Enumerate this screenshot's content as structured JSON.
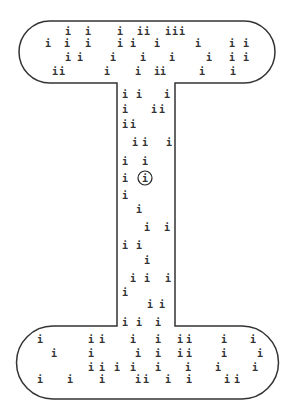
{
  "puzzle": {
    "shape": "I-beam",
    "glyph": "i",
    "colors": {
      "ink": "#333333",
      "background": "#ffffff"
    },
    "outline": {
      "top_bar": {
        "x": 19,
        "y": 21,
        "w": 256,
        "h": 62,
        "r": 31
      },
      "stem": {
        "x": 117,
        "w": 58
      },
      "bottom_bar": {
        "x": 20,
        "y": 326,
        "w": 255,
        "h": 73,
        "r": 33
      }
    },
    "circled": {
      "x": 145,
      "y": 178
    },
    "glyphs": [
      [
        68,
        31
      ],
      [
        88,
        31
      ],
      [
        120,
        31
      ],
      [
        140,
        31
      ],
      [
        147,
        31
      ],
      [
        168,
        31
      ],
      [
        175,
        31
      ],
      [
        182,
        31
      ],
      [
        48,
        43
      ],
      [
        67,
        43
      ],
      [
        88,
        43
      ],
      [
        120,
        43
      ],
      [
        133,
        43
      ],
      [
        157,
        43
      ],
      [
        198,
        43
      ],
      [
        232,
        43
      ],
      [
        246,
        43
      ],
      [
        68,
        57
      ],
      [
        80,
        57
      ],
      [
        113,
        57
      ],
      [
        143,
        57
      ],
      [
        172,
        57
      ],
      [
        209,
        57
      ],
      [
        232,
        57
      ],
      [
        246,
        57
      ],
      [
        55,
        71
      ],
      [
        62,
        71
      ],
      [
        107,
        71
      ],
      [
        138,
        71
      ],
      [
        157,
        71
      ],
      [
        163,
        71
      ],
      [
        202,
        71
      ],
      [
        233,
        71
      ],
      [
        125,
        94
      ],
      [
        139,
        94
      ],
      [
        167,
        94
      ],
      [
        125,
        109
      ],
      [
        154,
        109
      ],
      [
        162,
        109
      ],
      [
        125,
        124
      ],
      [
        133,
        124
      ],
      [
        135,
        142
      ],
      [
        145,
        142
      ],
      [
        169,
        142
      ],
      [
        125,
        161
      ],
      [
        145,
        161
      ],
      [
        125,
        178
      ],
      [
        145,
        178
      ],
      [
        125,
        195
      ],
      [
        139,
        209
      ],
      [
        147,
        227
      ],
      [
        167,
        227
      ],
      [
        125,
        245
      ],
      [
        139,
        245
      ],
      [
        147,
        260
      ],
      [
        133,
        278
      ],
      [
        147,
        278
      ],
      [
        168,
        278
      ],
      [
        125,
        292
      ],
      [
        150,
        304
      ],
      [
        162,
        304
      ],
      [
        125,
        322
      ],
      [
        139,
        322
      ],
      [
        158,
        322
      ],
      [
        40,
        339
      ],
      [
        91,
        339
      ],
      [
        102,
        339
      ],
      [
        133,
        339
      ],
      [
        158,
        339
      ],
      [
        180,
        339
      ],
      [
        189,
        339
      ],
      [
        224,
        339
      ],
      [
        253,
        339
      ],
      [
        54,
        353
      ],
      [
        91,
        353
      ],
      [
        138,
        353
      ],
      [
        158,
        353
      ],
      [
        180,
        353
      ],
      [
        189,
        353
      ],
      [
        224,
        353
      ],
      [
        260,
        353
      ],
      [
        91,
        367
      ],
      [
        102,
        367
      ],
      [
        117,
        367
      ],
      [
        133,
        367
      ],
      [
        158,
        367
      ],
      [
        188,
        367
      ],
      [
        218,
        367
      ],
      [
        255,
        367
      ],
      [
        40,
        379
      ],
      [
        70,
        379
      ],
      [
        102,
        379
      ],
      [
        138,
        379
      ],
      [
        146,
        379
      ],
      [
        168,
        379
      ],
      [
        189,
        379
      ],
      [
        227,
        379
      ],
      [
        237,
        379
      ]
    ]
  }
}
